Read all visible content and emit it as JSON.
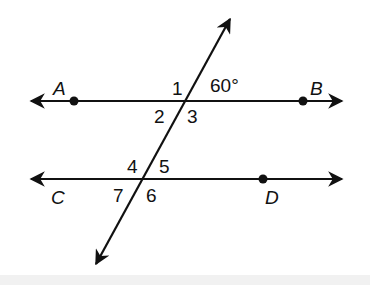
{
  "diagram": {
    "points": {
      "A": "A",
      "B": "B",
      "C": "C",
      "D": "D"
    },
    "angles": {
      "a1": "1",
      "a2": "2",
      "a3": "3",
      "a4": "4",
      "a5": "5",
      "a6": "6",
      "a7": "7"
    },
    "given_angle": "60°",
    "colors": {
      "line": "#111111",
      "background": "#ffffff"
    }
  }
}
